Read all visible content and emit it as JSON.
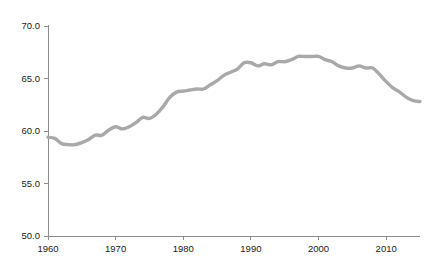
{
  "chart_data": {
    "type": "line",
    "title": "",
    "subtitle": "",
    "xlabel": "",
    "ylabel": "",
    "xlim": [
      1960,
      2015
    ],
    "ylim": [
      50.0,
      70.0
    ],
    "grid": false,
    "legend": null,
    "legend_position": "none",
    "line_color": "#a9a9a9",
    "line_width": 3.4,
    "axis_color": "#8c8c8c",
    "text_color": "#1a1a1a",
    "background": "#ffffff",
    "xticks": [
      1960,
      1970,
      1980,
      1990,
      2000,
      2010
    ],
    "xtick_labels": [
      "1960",
      "1970",
      "1980",
      "1990",
      "2000",
      "2010"
    ],
    "yticks": [
      50.0,
      55.0,
      60.0,
      65.0,
      70.0
    ],
    "ytick_labels": [
      "50.0",
      "55.0",
      "60.0",
      "65.0",
      "70.0"
    ],
    "series": [
      {
        "name": "series-1",
        "color": "#a9a9a9",
        "x": [
          1960,
          1961,
          1962,
          1963,
          1964,
          1965,
          1966,
          1967,
          1968,
          1969,
          1970,
          1971,
          1972,
          1973,
          1974,
          1975,
          1976,
          1977,
          1978,
          1979,
          1980,
          1981,
          1982,
          1983,
          1984,
          1985,
          1986,
          1987,
          1988,
          1989,
          1990,
          1991,
          1992,
          1993,
          1994,
          1995,
          1996,
          1997,
          1998,
          1999,
          2000,
          2001,
          2002,
          2003,
          2004,
          2005,
          2006,
          2007,
          2008,
          2009,
          2010,
          2011,
          2012,
          2013,
          2014,
          2015
        ],
        "values": [
          59.4,
          59.3,
          58.8,
          58.7,
          58.7,
          58.9,
          59.2,
          59.6,
          59.6,
          60.1,
          60.4,
          60.2,
          60.4,
          60.8,
          61.3,
          61.2,
          61.6,
          62.3,
          63.2,
          63.7,
          63.8,
          63.9,
          64.0,
          64.0,
          64.4,
          64.8,
          65.3,
          65.6,
          65.9,
          66.5,
          66.5,
          66.2,
          66.4,
          66.3,
          66.6,
          66.6,
          66.8,
          67.1,
          67.1,
          67.1,
          67.1,
          66.8,
          66.6,
          66.2,
          66.0,
          66.0,
          66.2,
          66.0,
          66.0,
          65.4,
          64.7,
          64.1,
          63.7,
          63.2,
          62.9,
          62.8
        ]
      }
    ],
    "annotations": []
  },
  "axes": {
    "y_axis_name": "y-axis",
    "x_axis_name": "x-axis"
  }
}
